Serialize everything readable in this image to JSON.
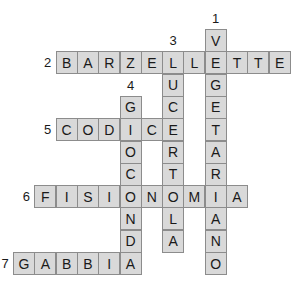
{
  "puzzle": {
    "origin_x": 13,
    "origin_y": 29,
    "cell_w": 21.3,
    "cell_h": 22.3,
    "fill_color": "#d9d9d9",
    "border_color": "#8c8c8c",
    "entries": [
      {
        "number": "1",
        "direction": "down",
        "answer": "VEGETARIANO",
        "col": 9,
        "row": 0
      },
      {
        "number": "2",
        "direction": "across",
        "answer": "BARZELLETTE",
        "col": 2,
        "row": 1
      },
      {
        "number": "3",
        "direction": "down",
        "answer": "LUCERTOLA",
        "col": 7,
        "row": 1
      },
      {
        "number": "4",
        "direction": "down",
        "answer": "GIOCONDA",
        "col": 5,
        "row": 3
      },
      {
        "number": "5",
        "direction": "across",
        "answer": "CODICE",
        "col": 2,
        "row": 4
      },
      {
        "number": "6",
        "direction": "across",
        "answer": "FISIONOMIA",
        "col": 1,
        "row": 7
      },
      {
        "number": "7",
        "direction": "across",
        "answer": "GABBIA",
        "col": 0,
        "row": 10
      }
    ]
  }
}
